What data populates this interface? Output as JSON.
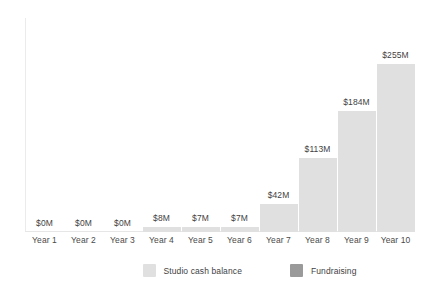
{
  "chart_data": {
    "type": "bar",
    "title": "",
    "xlabel": "",
    "ylabel": "",
    "ylim": [
      0,
      255
    ],
    "grid": false,
    "legend_position": "bottom",
    "categories": [
      "Year 1",
      "Year 2",
      "Year 3",
      "Year 4",
      "Year 5",
      "Year 6",
      "Year 7",
      "Year 8",
      "Year 9",
      "Year 10"
    ],
    "values": [
      0,
      0,
      0,
      8,
      7,
      7,
      42,
      113,
      184,
      255
    ],
    "value_labels": [
      "$0M",
      "$0M",
      "$0M",
      "$8M",
      "$7M",
      "$7M",
      "$42M",
      "$113M",
      "$184M",
      "$255M"
    ],
    "series": [
      {
        "name": "Studio cash balance",
        "color": "#e0e0e0",
        "values": [
          0,
          0,
          0,
          8,
          7,
          7,
          42,
          113,
          184,
          255
        ]
      },
      {
        "name": "Fundraising",
        "color": "#9a9a9a",
        "values": [
          0,
          0,
          0,
          0,
          0,
          0,
          0,
          0,
          0,
          0
        ]
      }
    ],
    "legend": [
      {
        "label": "Studio cash balance",
        "color": "#e0e0e0"
      },
      {
        "label": "Fundraising",
        "color": "#9a9a9a"
      }
    ]
  },
  "colors": {
    "bar_light": "#e0e0e0",
    "bar_dark": "#9a9a9a",
    "axis": "#e6e6e6",
    "text": "#3f3f3f",
    "background": "#ffffff"
  }
}
